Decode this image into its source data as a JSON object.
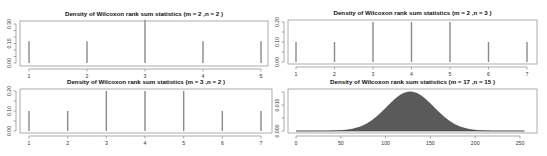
{
  "chart_data": [
    {
      "id": "m2n2",
      "type": "bar",
      "title": "Density of Wilcoxon rank sum statistics (m = 2 ,n = 2 )",
      "xlabel": "",
      "ylabel": "",
      "categories": [
        1,
        2,
        3,
        4,
        5
      ],
      "values": [
        0.1667,
        0.1667,
        0.3333,
        0.1667,
        0.1667
      ],
      "xlim": [
        1,
        5
      ],
      "ylim": [
        0,
        0.3333
      ],
      "xticks": [
        1,
        2,
        3,
        4,
        5
      ],
      "yticks": [
        0.0,
        0.05,
        0.1,
        0.15,
        0.2,
        0.25,
        0.3
      ],
      "ytick_labels": {
        "0": "0.00",
        "3": "0.15",
        "6": "0.30"
      },
      "grid": false,
      "style": "spikes",
      "layout": {
        "frame": [
          20,
          21,
          268,
          66
        ],
        "x_px": [
          29,
          261
        ],
        "y_px": [
          63,
          24
        ],
        "y_val": [
          0,
          0.3
        ],
        "title_y": 16
      }
    },
    {
      "id": "m2n3",
      "type": "bar",
      "title": "Density of Wilcoxon rank sum statistics (m = 2 ,n = 3 )",
      "xlabel": "",
      "ylabel": "",
      "categories": [
        1,
        2,
        3,
        4,
        5,
        6,
        7
      ],
      "values": [
        0.1,
        0.1,
        0.2,
        0.2,
        0.2,
        0.1,
        0.1
      ],
      "xlim": [
        1,
        7
      ],
      "ylim": [
        0,
        0.2
      ],
      "xticks": [
        1,
        2,
        3,
        4,
        5,
        6,
        7
      ],
      "yticks": [
        0.0,
        0.05,
        0.1,
        0.15,
        0.2
      ],
      "ytick_labels": {
        "0": "0.00",
        "2": "0.10",
        "4": "0.20"
      },
      "grid": false,
      "style": "spikes",
      "layout": {
        "frame": [
          288,
          20,
          537,
          64
        ],
        "x_px": [
          296,
          527
        ],
        "y_px": [
          62,
          22
        ],
        "y_val": [
          0,
          0.2
        ],
        "title_y": 15
      }
    },
    {
      "id": "m3n2",
      "type": "bar",
      "title": "Density of Wilcoxon rank sum statistics (m = 3 ,n = 2 )",
      "xlabel": "",
      "ylabel": "",
      "categories": [
        1,
        2,
        3,
        4,
        5,
        6,
        7
      ],
      "values": [
        0.1,
        0.1,
        0.2,
        0.2,
        0.2,
        0.1,
        0.1
      ],
      "xlim": [
        1,
        7
      ],
      "ylim": [
        0,
        0.2
      ],
      "xticks": [
        1,
        2,
        3,
        4,
        5,
        6,
        7
      ],
      "yticks": [
        0.0,
        0.05,
        0.1,
        0.15,
        0.2
      ],
      "ytick_labels": {
        "0": "0.00",
        "2": "0.10",
        "4": "0.20"
      },
      "grid": false,
      "style": "spikes",
      "layout": {
        "frame": [
          20,
          89,
          272,
          133
        ],
        "x_px": [
          29,
          261
        ],
        "y_px": [
          131,
          91
        ],
        "y_val": [
          0,
          0.2
        ],
        "title_y": 84
      }
    },
    {
      "id": "m17n15",
      "type": "area",
      "title": "Density of Wilcoxon rank sum statistics (m = 17 ,n = 15 )",
      "xlabel": "",
      "ylabel": "",
      "x_range": [
        0,
        255
      ],
      "distribution": {
        "mean": 127.5,
        "sd": 26.48,
        "peak": 0.01507
      },
      "xlim": [
        0,
        255
      ],
      "ylim": [
        0,
        0.0151
      ],
      "xticks": [
        0,
        50,
        100,
        150,
        200,
        250
      ],
      "yticks": [
        0.0,
        0.005,
        0.01,
        0.015
      ],
      "ytick_labels": {
        "0": "0.000",
        "2": "0.010"
      },
      "grid": false,
      "style": "filled-density",
      "fill_color": "#5a5a5a",
      "layout": {
        "frame": [
          288,
          89,
          537,
          133
        ],
        "x_px": [
          296,
          520
        ],
        "x_val": [
          0,
          250
        ],
        "y_px": [
          131,
          105
        ],
        "y_val": [
          0,
          0.01
        ],
        "title_y": 84
      }
    }
  ]
}
